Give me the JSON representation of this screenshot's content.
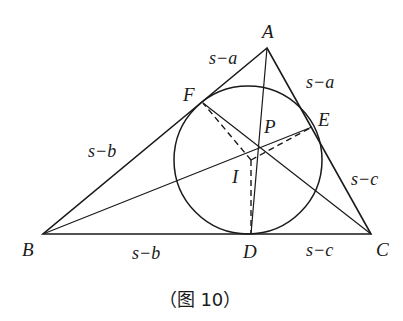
{
  "figure": {
    "caption": "（图 10）",
    "stroke_color": "#1a1a1a",
    "points": {
      "A": {
        "label": "A",
        "x": 267,
        "y": 48
      },
      "B": {
        "label": "B",
        "x": 43,
        "y": 234
      },
      "C": {
        "label": "C",
        "x": 371,
        "y": 234
      },
      "D": {
        "label": "D",
        "x": 251,
        "y": 234
      },
      "E": {
        "label": "E",
        "x": 312,
        "y": 127
      },
      "F": {
        "label": "F",
        "x": 203,
        "y": 103
      },
      "P": {
        "label": "P",
        "x": 259,
        "y": 147
      },
      "I": {
        "label": "I",
        "x": 251,
        "y": 160
      }
    },
    "incircle": {
      "cx": 248,
      "cy": 160,
      "r": 74
    },
    "segment_labels": {
      "AF": "s−a",
      "AE": "s−a",
      "BF": "s−b",
      "BD": "s−b",
      "CE": "s−c",
      "CD": "s−c"
    }
  }
}
